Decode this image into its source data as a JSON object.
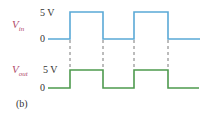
{
  "figure": {
    "panel_label": "(b)",
    "traces": [
      {
        "name": "input",
        "signal_label_main": "V",
        "signal_label_sub": "in",
        "high_label": "5 V",
        "low_label": "0",
        "color": "#5aa9d6"
      },
      {
        "name": "output",
        "signal_label_main": "V",
        "signal_label_sub": "out",
        "high_label": "5 V",
        "low_label": "0",
        "color": "#4e9a4e"
      }
    ],
    "dashed_color": "#555555",
    "label_color": "#b04a6a"
  }
}
